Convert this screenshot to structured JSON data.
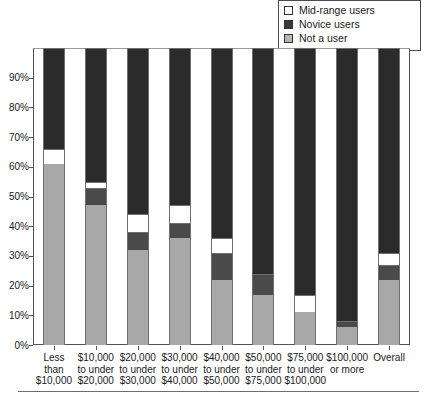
{
  "legend": {
    "position": "top-right",
    "items": [
      {
        "label": "Mid-range users",
        "swatch": "#ffffff",
        "icon": "legend-swatch-midrange"
      },
      {
        "label": "Novice users",
        "swatch": "#3a3a3a",
        "icon": "legend-swatch-novice"
      },
      {
        "label": "Not a user",
        "swatch": "#b5b5b5",
        "icon": "legend-swatch-notauser"
      }
    ]
  },
  "colors": {
    "not_a_user": "#a8a8a8",
    "novice_users": "#4a4a4a",
    "mid_range_users": "#ffffff",
    "advanced_users": "#2b2b2b",
    "axis": "#555555",
    "bar_outline": "#6f6f6f"
  },
  "chart_data": {
    "type": "bar",
    "subtype": "stacked-100",
    "title": "",
    "xlabel": "",
    "ylabel": "",
    "ylim": [
      0,
      100
    ],
    "grid": false,
    "legend_position": "top-right",
    "y_ticks": [
      "0%",
      "10%",
      "20%",
      "30%",
      "40%",
      "50%",
      "60%",
      "70%",
      "80%",
      "90%"
    ],
    "y_tick_values": [
      0,
      10,
      20,
      30,
      40,
      50,
      60,
      70,
      80,
      90
    ],
    "categories": [
      "Less than $10,000",
      "$10,000 to under $20,000",
      "$20,000 to under $30,000",
      "$30,000 to under $40,000",
      "$40,000 to under $50,000",
      "$50,000 to under $75,000",
      "$75,000 to under $100,000",
      "$100,000 or more",
      "Overall"
    ],
    "category_lines": [
      [
        "Less",
        "than",
        "$10,000"
      ],
      [
        "$10,000",
        "to under",
        "$20,000"
      ],
      [
        "$20,000",
        "to under",
        "$30,000"
      ],
      [
        "$30,000",
        "to under",
        "$40,000"
      ],
      [
        "$40,000",
        "to under",
        "$50,000"
      ],
      [
        "$50,000",
        "to under",
        "$75,000"
      ],
      [
        "$75,000",
        "to under",
        "$100,000"
      ],
      [
        "$100,000",
        "or more"
      ],
      [
        "Overall"
      ]
    ],
    "series": [
      {
        "name": "Not a user",
        "color": "#a8a8a8",
        "values": [
          61,
          47,
          32,
          36,
          22,
          17,
          11,
          6,
          22
        ]
      },
      {
        "name": "Novice users",
        "color": "#4a4a4a",
        "values": [
          0,
          6,
          6,
          5,
          9,
          7,
          0,
          2,
          5
        ]
      },
      {
        "name": "Mid-range users",
        "color": "#ffffff",
        "values": [
          5,
          2,
          6,
          6,
          5,
          0,
          6,
          0,
          4
        ]
      },
      {
        "name": "Advanced users",
        "color": "#2b2b2b",
        "values": [
          34,
          45,
          56,
          53,
          64,
          76,
          83,
          92,
          69
        ]
      }
    ]
  }
}
